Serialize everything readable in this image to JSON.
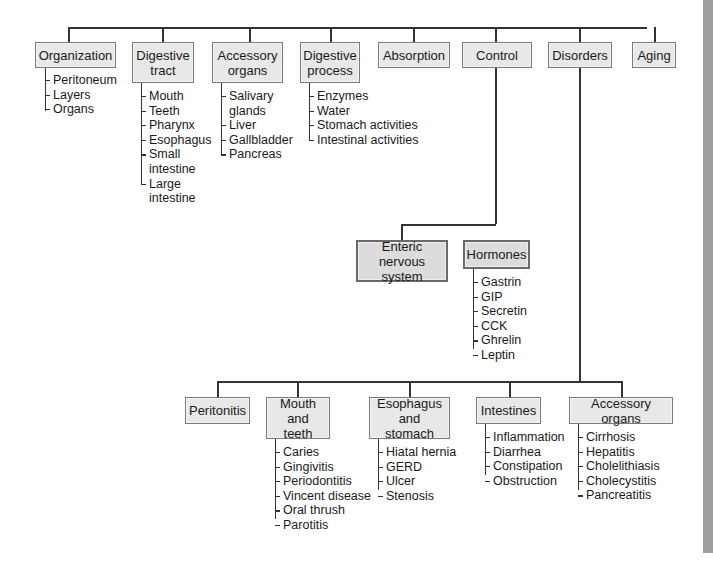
{
  "diagram": {
    "type": "hierarchy",
    "top_level": [
      {
        "label": "Organization",
        "children": [
          "Peritoneum",
          "Layers",
          "Organs"
        ]
      },
      {
        "label": "Digestive\ntract",
        "children": [
          "Mouth",
          "Teeth",
          "Pharynx",
          "Esophagus",
          "Small\n  intestine",
          "Large\n  intestine"
        ]
      },
      {
        "label": "Accessory\norgans",
        "children": [
          "Salivary\n  glands",
          "Liver",
          "Gallbladder",
          "Pancreas"
        ]
      },
      {
        "label": "Digestive\nprocess",
        "children": [
          "Enzymes",
          "Water",
          "Stomach activities",
          "Intestinal activities"
        ]
      },
      {
        "label": "Absorption",
        "children": []
      },
      {
        "label": "Control",
        "children": []
      },
      {
        "label": "Disorders",
        "children": []
      },
      {
        "label": "Aging",
        "children": []
      }
    ],
    "control": {
      "children": [
        {
          "label": "Enteric\nnervous system",
          "children": []
        },
        {
          "label": "Hormones",
          "children": [
            "Gastrin",
            "GIP",
            "Secretin",
            "CCK",
            "Ghrelin",
            "Leptin"
          ]
        }
      ]
    },
    "disorders": {
      "children": [
        {
          "label": "Peritonitis",
          "children": []
        },
        {
          "label": "Mouth\nand teeth",
          "children": [
            "Caries",
            "Gingivitis",
            "Periodontitis",
            "Vincent disease",
            "Oral thrush",
            "Parotitis"
          ]
        },
        {
          "label": "Esophagus\nand stomach",
          "children": [
            "Hiatal hernia",
            "GERD",
            "Ulcer",
            "Stenosis"
          ]
        },
        {
          "label": "Intestines",
          "children": [
            "Inflammation",
            "Diarrhea",
            "Constipation",
            "Obstruction"
          ]
        },
        {
          "label": "Accessory organs",
          "children": [
            "Cirrhosis",
            "Hepatitis",
            "Cholelithiasis",
            "Cholecystitis",
            "Pancreatitis"
          ]
        }
      ]
    }
  }
}
